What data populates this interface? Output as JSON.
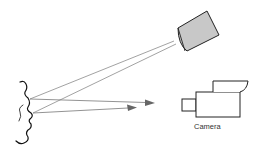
{
  "diagram": {
    "camera_label": "Camera",
    "colors": {
      "background": "#ffffff",
      "light_source_fill": "#c8c8c8",
      "outline": "#222222",
      "ray": "#777777",
      "arrow": "#666666"
    },
    "elements": [
      {
        "id": "face-profile",
        "type": "face outline"
      },
      {
        "id": "light-source",
        "type": "projector box"
      },
      {
        "id": "camera",
        "type": "video camera",
        "label": "Camera"
      },
      {
        "id": "incident-rays",
        "count": 2
      },
      {
        "id": "reflected-arrows",
        "count": 2
      }
    ]
  }
}
